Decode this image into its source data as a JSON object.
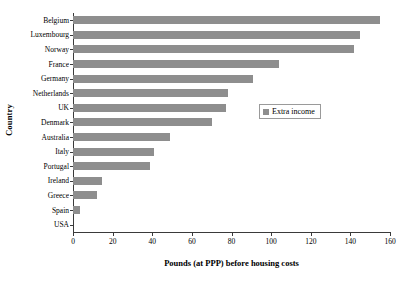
{
  "chart_data": {
    "type": "bar",
    "orientation": "horizontal",
    "title": "",
    "xlabel": "Pounds (at PPP) before housing costs",
    "ylabel": "Country",
    "categories": [
      "Belgium",
      "Luxembourg",
      "Norway",
      "France",
      "Germany",
      "Netherlands",
      "UK",
      "Denmark",
      "Australia",
      "Italy",
      "Portugal",
      "Ireland",
      "Greece",
      "Spain",
      "USA"
    ],
    "values": [
      155,
      145,
      142,
      104,
      91,
      78,
      77,
      70,
      49,
      41,
      39,
      14.5,
      12,
      3.5,
      0
    ],
    "series": [
      {
        "name": "Extra income",
        "color": "#8e8e8e",
        "values": [
          155,
          145,
          142,
          104,
          91,
          78,
          77,
          70,
          49,
          41,
          39,
          14.5,
          12,
          3.5,
          0
        ]
      }
    ],
    "xlim": [
      0,
      160
    ],
    "xticks": [
      0,
      20,
      40,
      60,
      80,
      100,
      120,
      140,
      160
    ],
    "xtick_labels": [
      "0",
      "20",
      "40",
      "60",
      "80",
      "100",
      "120",
      "140",
      "160"
    ],
    "grid": false,
    "legend": {
      "position": "center-right",
      "entries": [
        {
          "label": "Extra income",
          "color": "#8e8e8e",
          "marker": "square-swatch"
        }
      ]
    }
  }
}
